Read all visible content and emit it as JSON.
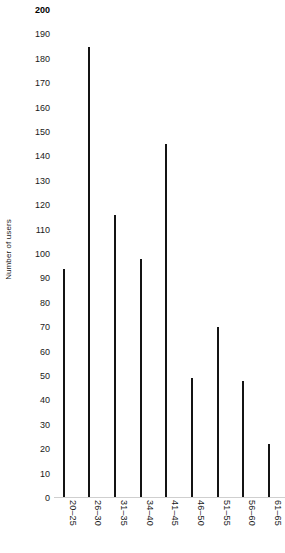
{
  "chart_data": {
    "type": "bar",
    "title": "",
    "xlabel": "",
    "ylabel": "Number of users",
    "categories": [
      "20–25",
      "26–30",
      "31–35",
      "34–40",
      "41–45",
      "46–50",
      "51–55",
      "56–60",
      "61–65"
    ],
    "values": [
      94,
      185,
      116,
      98,
      145,
      49,
      70,
      48,
      22
    ],
    "ylim": [
      0,
      200
    ],
    "ytick_step": 10,
    "yticks": [
      200,
      190,
      180,
      170,
      160,
      150,
      140,
      130,
      120,
      110,
      100,
      90,
      80,
      70,
      60,
      50,
      40,
      30,
      20,
      10,
      0
    ],
    "ytick_labels": [
      "200",
      "190",
      "180",
      "170",
      "160",
      "150",
      "140",
      "130",
      "120",
      "110",
      "100",
      "90",
      "80",
      "70",
      "60",
      "50",
      "40",
      "30",
      "20",
      "10",
      "0"
    ],
    "emphasized_ytick": "200",
    "grid": false,
    "legend": null,
    "bar_color": "#141414",
    "background_color": "#ffffff",
    "axis_color": "#cfcfcf",
    "text_color": "#1a1a1a",
    "xtick_rotation": 90,
    "ylabel_rotation": 90,
    "bar_style": "thin-line"
  }
}
